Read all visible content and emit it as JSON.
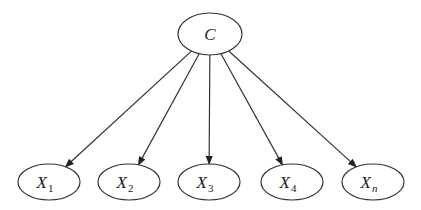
{
  "diagram": {
    "type": "directed-graph",
    "colors": {
      "stroke": "#333333",
      "background": "#ffffff",
      "text": "#222222"
    },
    "root": {
      "id": "C",
      "label": "C",
      "cx": 210,
      "cy": 34,
      "rx": 32,
      "ry": 21
    },
    "children": [
      {
        "id": "X1",
        "label": "X",
        "sub": "1",
        "sub_italic": false,
        "cx": 49,
        "cy": 182,
        "rx": 31,
        "ry": 18
      },
      {
        "id": "X2",
        "label": "X",
        "sub": "2",
        "sub_italic": false,
        "cx": 129,
        "cy": 182,
        "rx": 31,
        "ry": 18
      },
      {
        "id": "X3",
        "label": "X",
        "sub": "3",
        "sub_italic": false,
        "cx": 209,
        "cy": 182,
        "rx": 31,
        "ry": 18
      },
      {
        "id": "X4",
        "label": "X",
        "sub": "4",
        "sub_italic": false,
        "cx": 292,
        "cy": 182,
        "rx": 31,
        "ry": 18
      },
      {
        "id": "Xn",
        "label": "X",
        "sub": "n",
        "sub_italic": true,
        "cx": 373,
        "cy": 182,
        "rx": 31,
        "ry": 18
      }
    ],
    "edges": [
      {
        "from": "C",
        "to": "X1"
      },
      {
        "from": "C",
        "to": "X2"
      },
      {
        "from": "C",
        "to": "X3"
      },
      {
        "from": "C",
        "to": "X4"
      },
      {
        "from": "C",
        "to": "Xn"
      }
    ]
  }
}
